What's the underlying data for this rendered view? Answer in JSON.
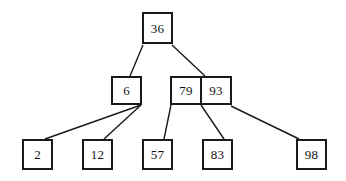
{
  "diagram": {
    "type": "b-tree",
    "background_color": "#ffffff",
    "stroke_color": "#1a1a1a",
    "text_color": "#111111",
    "nodes": [
      {
        "id": "root",
        "level": 0,
        "keys": [
          "36"
        ],
        "x": 142,
        "y": 12,
        "width": 31,
        "height": 32
      },
      {
        "id": "internal-left",
        "level": 1,
        "keys": [
          "6"
        ],
        "x": 111,
        "y": 76,
        "width": 31,
        "height": 29
      },
      {
        "id": "internal-right",
        "level": 1,
        "keys": [
          "79",
          "93"
        ],
        "x": 170,
        "y": 76,
        "width": 62,
        "height": 29
      },
      {
        "id": "leaf-2",
        "level": 2,
        "keys": [
          "2"
        ],
        "x": 22,
        "y": 139,
        "width": 31,
        "height": 31
      },
      {
        "id": "leaf-12",
        "level": 2,
        "keys": [
          "12"
        ],
        "x": 82,
        "y": 139,
        "width": 31,
        "height": 31
      },
      {
        "id": "leaf-57",
        "level": 2,
        "keys": [
          "57"
        ],
        "x": 142,
        "y": 139,
        "width": 31,
        "height": 31
      },
      {
        "id": "leaf-83",
        "level": 2,
        "keys": [
          "83"
        ],
        "x": 202,
        "y": 139,
        "width": 31,
        "height": 31
      },
      {
        "id": "leaf-98",
        "level": 2,
        "keys": [
          "98"
        ],
        "x": 296,
        "y": 139,
        "width": 31,
        "height": 31
      }
    ],
    "edges": [
      {
        "id": "edge-root-left",
        "from": "root",
        "to": "internal-left",
        "x1": 143,
        "y1": 45,
        "x2": 130,
        "y2": 76
      },
      {
        "id": "edge-root-right",
        "from": "root",
        "to": "internal-right",
        "x1": 172,
        "y1": 45,
        "x2": 205,
        "y2": 76
      },
      {
        "id": "edge-left-2",
        "from": "internal-left",
        "to": "leaf-2",
        "x1": 141,
        "y1": 105,
        "x2": 45,
        "y2": 139
      },
      {
        "id": "edge-left-12",
        "from": "internal-left",
        "to": "leaf-12",
        "x1": 141,
        "y1": 105,
        "x2": 104,
        "y2": 139
      },
      {
        "id": "edge-right-57",
        "from": "internal-right",
        "to": "leaf-57",
        "x1": 171,
        "y1": 105,
        "x2": 164,
        "y2": 139
      },
      {
        "id": "edge-right-83",
        "from": "internal-right",
        "to": "leaf-83",
        "x1": 201,
        "y1": 105,
        "x2": 224,
        "y2": 139
      },
      {
        "id": "edge-right-98",
        "from": "internal-right",
        "to": "leaf-98",
        "x1": 231,
        "y1": 106,
        "x2": 299,
        "y2": 139
      }
    ]
  }
}
